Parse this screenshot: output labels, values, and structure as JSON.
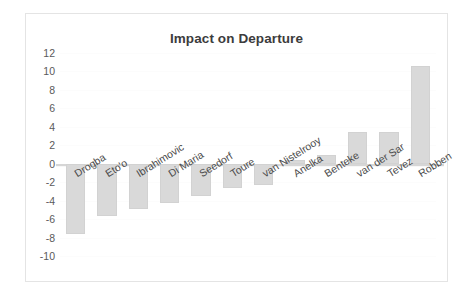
{
  "chart_data": {
    "type": "bar",
    "title": "Impact on Departure",
    "xlabel": "",
    "ylabel": "",
    "ylim": [
      -10,
      12
    ],
    "yticks": [
      12,
      10,
      8,
      6,
      4,
      2,
      0,
      -2,
      -4,
      -6,
      -8,
      -10
    ],
    "grid": false,
    "legend": false,
    "bar_color": "#d9d9d9",
    "categories": [
      "Drogba",
      "Eto'o",
      "Ibrahimovic",
      "Di Maria",
      "Seedorf",
      "Toure",
      "van Nistelrooy",
      "Anelka",
      "Benteke",
      "van der Sar",
      "Tevez",
      "Robben"
    ],
    "values": [
      -7.6,
      -5.7,
      -4.9,
      -4.3,
      -3.5,
      -2.6,
      -2.3,
      0.4,
      1.0,
      3.4,
      3.4,
      10.6
    ]
  }
}
